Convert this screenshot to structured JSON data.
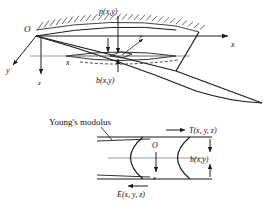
{
  "figure": {
    "background_color": "#ffffff",
    "line_color": "#1a1a1a",
    "upper_panel": {
      "name": "three-dimensional fracture perspective view",
      "labels": {
        "origin": "O",
        "axis_x": "x",
        "axis_y": "y",
        "axis_z": "z",
        "pressure": "p(x,y)",
        "width": "b(x,y)",
        "inset_y": "y",
        "coordinate_x": "x"
      }
    },
    "lower_panel": {
      "name": "fracture cross-section with material properties",
      "labels": {
        "youngs_modulus_caption": "Young's modolus",
        "traction": "T(x, y, z)",
        "modulus": "E(x, y, z)",
        "width": "b(x,y)",
        "origin": "O",
        "axis_z": "z"
      }
    }
  }
}
